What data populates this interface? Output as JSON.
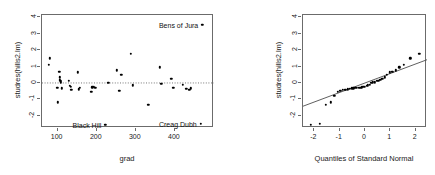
{
  "figure": {
    "background": "#ffffff",
    "frame_color": "#6b6b6b",
    "point_color": "#000000",
    "reference_line_color": "#555555"
  },
  "chart_data": [
    {
      "type": "scatter",
      "title": "",
      "xlabel": "grad",
      "ylabel": "studres(hills2.lm)",
      "xlim": [
        60,
        500
      ],
      "ylim": [
        -2.75,
        4.15
      ],
      "xticks": [
        100,
        200,
        300,
        400
      ],
      "yticks": [
        -2,
        -1,
        0,
        1,
        2,
        3,
        4
      ],
      "grid": false,
      "legend": "none",
      "hline": {
        "y": 0,
        "style": "dotted"
      },
      "x": [
        78,
        80,
        99,
        101,
        104,
        105,
        106,
        107,
        108,
        110,
        129,
        131,
        133,
        135,
        152,
        154,
        157,
        186,
        189,
        193,
        196,
        222,
        230,
        252,
        258,
        263,
        287,
        292,
        332,
        361,
        365,
        391,
        396,
        420,
        429,
        437,
        441,
        466,
        470
      ],
      "y": [
        1.12,
        1.5,
        -0.28,
        -1.19,
        0.7,
        0.35,
        0.2,
        0.12,
        0.05,
        -0.32,
        0.15,
        -0.18,
        -0.22,
        -0.42,
        0.65,
        -0.38,
        -0.3,
        -0.55,
        -0.26,
        -0.22,
        -0.3,
        -2.55,
        0.02,
        0.78,
        -0.48,
        0.5,
        1.77,
        -0.15,
        -1.35,
        0.96,
        -0.05,
        0.25,
        -0.3,
        -0.12,
        -0.35,
        -0.42,
        -0.32,
        -2.5,
        3.55
      ],
      "annotations": [
        {
          "text": "Bens of Jura",
          "x": 470,
          "y": 3.55,
          "anchor": "right"
        },
        {
          "text": "Black Hill",
          "x": 222,
          "y": -2.55,
          "anchor": "right"
        },
        {
          "text": "Creag Dubh",
          "x": 466,
          "y": -2.5,
          "anchor": "right"
        }
      ]
    },
    {
      "type": "scatter",
      "title": "",
      "xlabel": "Quantiles of Standard Normal",
      "ylabel": "studres(hills2.lm)",
      "xlim": [
        -2.45,
        2.45
      ],
      "ylim": [
        -2.75,
        4.15
      ],
      "xticks": [
        -2,
        -1,
        0,
        1,
        2
      ],
      "yticks": [
        -2,
        -1,
        0,
        1,
        2,
        3,
        4
      ],
      "grid": false,
      "legend": "none",
      "qq_line": {
        "x1": -2.45,
        "y1": -1.42,
        "x2": 2.45,
        "y2": 1.42
      },
      "x": [
        -2.14,
        -1.79,
        -1.54,
        -1.36,
        -1.21,
        -1.08,
        -0.97,
        -0.87,
        -0.78,
        -0.69,
        -0.61,
        -0.53,
        -0.46,
        -0.39,
        -0.32,
        -0.25,
        -0.19,
        -0.12,
        -0.06,
        0.0,
        0.06,
        0.12,
        0.19,
        0.25,
        0.32,
        0.39,
        0.46,
        0.53,
        0.61,
        0.69,
        0.78,
        0.87,
        0.97,
        1.08,
        1.21,
        1.36,
        1.54,
        1.79,
        2.14
      ],
      "y": [
        -2.55,
        -2.5,
        -1.35,
        -1.19,
        -0.78,
        -0.55,
        -0.48,
        -0.42,
        -0.42,
        -0.38,
        -0.35,
        -0.32,
        -0.32,
        -0.3,
        -0.3,
        -0.3,
        -0.28,
        -0.26,
        -0.22,
        -0.22,
        -0.18,
        -0.15,
        -0.12,
        0.02,
        0.05,
        0.05,
        0.12,
        0.15,
        0.2,
        0.25,
        0.35,
        0.5,
        0.65,
        0.7,
        0.78,
        0.96,
        1.12,
        1.5,
        1.77,
        3.55
      ],
      "annotations": []
    }
  ],
  "left_plot": {
    "xlabel": "grad",
    "ylabel": "studres(hills2.lm)",
    "xticks": [
      "100",
      "200",
      "300",
      "400"
    ],
    "yticks": [
      "4",
      "3",
      "2",
      "1",
      "0",
      "-1",
      "-2"
    ],
    "labels": {
      "bens_of_jura": "Bens of Jura",
      "black_hill": "Black Hill",
      "creag_dubh": "Creag Dubh"
    }
  },
  "right_plot": {
    "xlabel": "Quantiles of Standard Normal",
    "ylabel": "studres(hills2.lm)",
    "xticks": [
      "-2",
      "-1",
      "0",
      "1",
      "2"
    ],
    "yticks": [
      "4",
      "3",
      "2",
      "1",
      "0",
      "-1",
      "-2"
    ]
  }
}
